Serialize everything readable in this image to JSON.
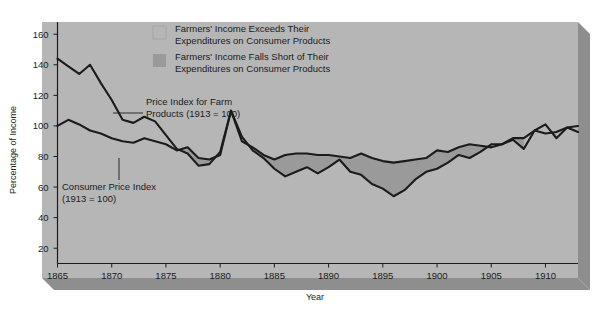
{
  "figure": {
    "panel_color": "#b6b6b6",
    "panel_shadow_color": "#8e8e8e",
    "page_background": "#ffffff",
    "line_color": "#1b1b1b",
    "surplus_fill": "#b6b6b6",
    "deficit_fill": "#9a9a9a"
  },
  "axes": {
    "ylabel": "Percentage of Income",
    "xlabel": "Year",
    "yticks": [
      20,
      40,
      60,
      80,
      100,
      120,
      140,
      160
    ],
    "xticks": [
      1865,
      1870,
      1875,
      1880,
      1885,
      1890,
      1895,
      1900,
      1905,
      1910
    ],
    "ylim": [
      10,
      168
    ],
    "xlim": [
      1865,
      1913
    ],
    "grid": false
  },
  "legend": {
    "position": "top-center",
    "entries": [
      {
        "swatch": "#b6b6b6",
        "line1": "Farmers' Income Exceeds Their",
        "line2": "Expenditures on Consumer Products"
      },
      {
        "swatch": "#9a9a9a",
        "line1": "Farmers' Income Falls Short of Their",
        "line2": "Expenditures on Consumer Products"
      }
    ]
  },
  "callouts": [
    {
      "name": "farm-price-index-callout",
      "line1": "Price Index for Farm",
      "line2": "Products (1913 = 100)"
    },
    {
      "name": "consumer-price-index-callout",
      "line1": "Consumer Price Index",
      "line2": "(1913 = 100)"
    }
  ],
  "chart_data": {
    "type": "line",
    "title": "",
    "xlabel": "Year",
    "ylabel": "Percentage of Income",
    "xlim": [
      1865,
      1913
    ],
    "ylim": [
      10,
      168
    ],
    "grid": false,
    "x": [
      1865,
      1866,
      1867,
      1868,
      1869,
      1870,
      1871,
      1872,
      1873,
      1874,
      1875,
      1876,
      1877,
      1878,
      1879,
      1880,
      1881,
      1882,
      1883,
      1884,
      1885,
      1886,
      1887,
      1888,
      1889,
      1890,
      1891,
      1892,
      1893,
      1894,
      1895,
      1896,
      1897,
      1898,
      1899,
      1900,
      1901,
      1902,
      1903,
      1904,
      1905,
      1906,
      1907,
      1908,
      1909,
      1910,
      1911,
      1912,
      1913
    ],
    "series": [
      {
        "name": "Price Index for Farm Products (1913 = 100)",
        "values": [
          144,
          139,
          134,
          140,
          128,
          117,
          104,
          102,
          106,
          103,
          94,
          85,
          82,
          74,
          75,
          83,
          110,
          93,
          84,
          79,
          72,
          67,
          70,
          73,
          69,
          73,
          78,
          70,
          68,
          62,
          59,
          54,
          58,
          65,
          70,
          72,
          76,
          81,
          79,
          83,
          88,
          88,
          91,
          85,
          97,
          101,
          92,
          99,
          96
        ]
      },
      {
        "name": "Consumer Price Index (1913 = 100)",
        "values": [
          100,
          104,
          101,
          97,
          95,
          92,
          90,
          89,
          92,
          90,
          88,
          84,
          86,
          79,
          78,
          81,
          110,
          90,
          86,
          81,
          78,
          81,
          82,
          82,
          81,
          81,
          80,
          79,
          82,
          79,
          77,
          76,
          77,
          78,
          79,
          84,
          83,
          86,
          88,
          87,
          86,
          88,
          92,
          92,
          97,
          95,
          96,
          99,
          100
        ]
      }
    ]
  }
}
